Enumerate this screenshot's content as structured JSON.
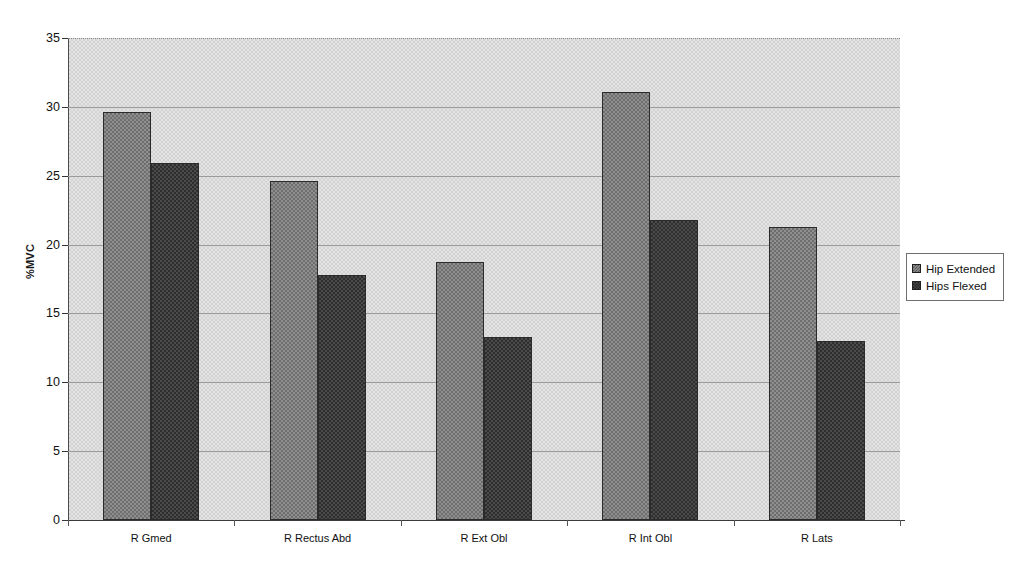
{
  "chart_data": {
    "type": "bar",
    "title": "",
    "xlabel": "",
    "ylabel": "%MVC",
    "ylim": [
      0,
      35
    ],
    "ytick_step": 5,
    "yticks": [
      0,
      5,
      10,
      15,
      20,
      25,
      30,
      35
    ],
    "grid": true,
    "legend_position": "right",
    "categories": [
      "R Gmed",
      "R Rectus Abd",
      "R Ext Obl",
      "R Int Obl",
      "R Lats"
    ],
    "series": [
      {
        "name": "Hip Extended",
        "values": [
          29.6,
          24.6,
          18.7,
          31.1,
          21.3
        ],
        "color": "#8f8f8f"
      },
      {
        "name": "Hips Flexed",
        "values": [
          25.9,
          17.8,
          13.3,
          21.8,
          13.0
        ],
        "color": "#4b4b4b"
      }
    ]
  },
  "legend": {
    "entries": [
      "Hip Extended",
      "Hips Flexed"
    ]
  },
  "axes": {
    "y_title": "%MVC"
  }
}
